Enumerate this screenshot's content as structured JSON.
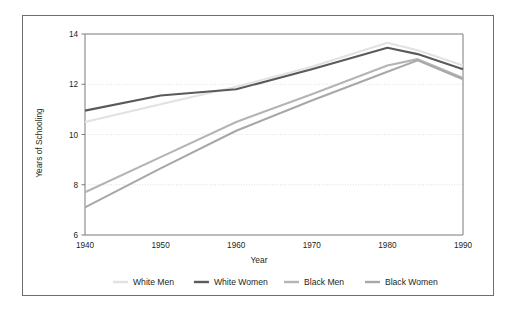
{
  "chart_data": {
    "type": "line",
    "title": "",
    "xlabel": "Year",
    "ylabel": "Years of Schooling",
    "xlim": [
      1940,
      1990
    ],
    "ylim": [
      6,
      14
    ],
    "xticks": [
      1940,
      1950,
      1960,
      1970,
      1980,
      1990
    ],
    "yticks": [
      6,
      8,
      10,
      12,
      14
    ],
    "grid": "horizontal-dotted",
    "legend_position": "bottom",
    "x": [
      1940,
      1950,
      1960,
      1970,
      1980,
      1984,
      1990
    ],
    "series": [
      {
        "name": "White Men",
        "color": "#e2e2e2",
        "values": [
          10.5,
          11.2,
          11.9,
          12.7,
          13.65,
          13.35,
          12.75
        ]
      },
      {
        "name": "White Women",
        "color": "#5a5a5a",
        "values": [
          10.95,
          11.55,
          11.8,
          12.6,
          13.45,
          13.2,
          12.6
        ]
      },
      {
        "name": "Black Men",
        "color": "#b4b4b4",
        "values": [
          7.7,
          9.1,
          10.5,
          11.6,
          12.75,
          13.0,
          12.25
        ]
      },
      {
        "name": "Black Women",
        "color": "#a8a8a8",
        "values": [
          7.1,
          8.65,
          10.15,
          11.35,
          12.5,
          12.95,
          12.2
        ]
      }
    ]
  },
  "legend": {
    "items": [
      {
        "label": "White Men"
      },
      {
        "label": "White Women"
      },
      {
        "label": "Black Men"
      },
      {
        "label": "Black Women"
      }
    ]
  },
  "axes": {
    "x_title": "Year",
    "y_title": "Years of Schooling",
    "x_tick_labels": [
      "1940",
      "1950",
      "1960",
      "1970",
      "1980",
      "1990"
    ],
    "y_tick_labels": [
      "6",
      "8",
      "10",
      "12",
      "14"
    ]
  }
}
